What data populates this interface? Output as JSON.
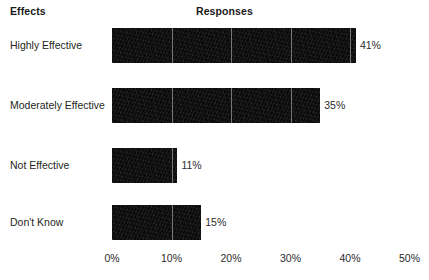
{
  "header": {
    "category_column_label": "Effects",
    "value_column_label": "Responses"
  },
  "chart_data": {
    "type": "bar",
    "orientation": "horizontal",
    "title": "Responses",
    "xlabel": "",
    "ylabel": "Effects",
    "categories": [
      "Highly Effective",
      "Moderately Effective",
      "Not Effective",
      "Don't Know"
    ],
    "values": [
      41,
      35,
      11,
      15
    ],
    "data_labels": [
      "41%",
      "35%",
      "11%",
      "15%"
    ],
    "xlim": [
      0,
      50
    ],
    "xticks": [
      0,
      10,
      20,
      30,
      40,
      50
    ],
    "xtick_labels": [
      "0%",
      "10%",
      "20%",
      "30%",
      "40%",
      "50%"
    ],
    "grid": true,
    "legend": null,
    "bar_color": "#0a0a0a",
    "gridline_color": "#c8c8c8",
    "background_color": "#ffffff",
    "text_color": "#231f20"
  }
}
